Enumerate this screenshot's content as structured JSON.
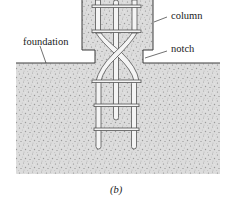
{
  "figure": {
    "caption": "(b)",
    "labels": {
      "column": "column",
      "notch": "notch",
      "foundation": "foundation"
    }
  },
  "colors": {
    "concrete_fill": "#d9d9d9",
    "outline": "#3a3a3a",
    "rebar_fill": "#f4f4f4",
    "rebar_stroke": "#555555",
    "text": "#1a1a1a"
  }
}
